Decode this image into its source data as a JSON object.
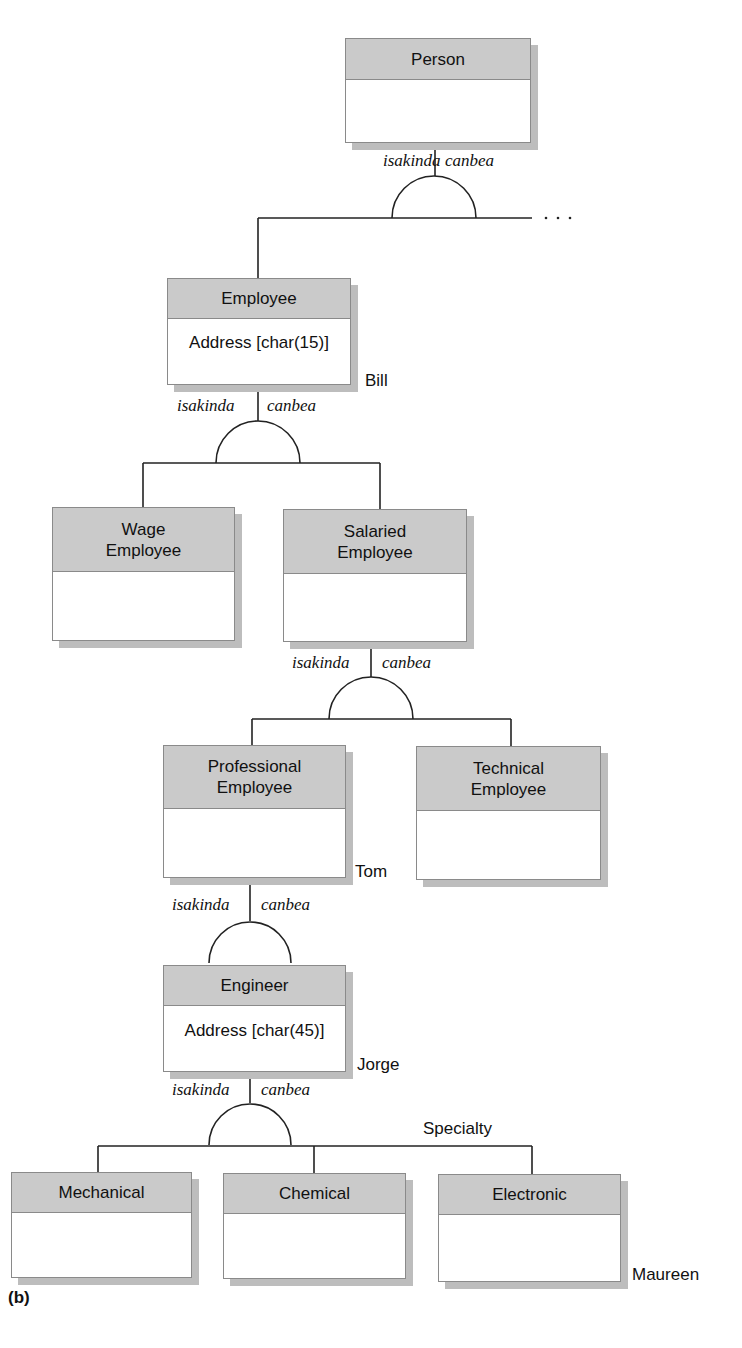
{
  "entities": {
    "person": {
      "name": "Person"
    },
    "employee": {
      "name": "Employee",
      "attribute": "Address [char(15)]"
    },
    "wage_employee": {
      "name_line1": "Wage",
      "name_line2": "Employee"
    },
    "salaried_employee": {
      "name_line1": "Salaried",
      "name_line2": "Employee"
    },
    "professional_employee": {
      "name_line1": "Professional",
      "name_line2": "Employee"
    },
    "technical_employee": {
      "name_line1": "Technical",
      "name_line2": "Employee"
    },
    "engineer": {
      "name": "Engineer",
      "attribute": "Address [char(45)]"
    },
    "mechanical": {
      "name": "Mechanical"
    },
    "chemical": {
      "name": "Chemical"
    },
    "electronic": {
      "name": "Electronic"
    }
  },
  "relationship_labels": {
    "left": "isakinda",
    "right": "canbea"
  },
  "instances": {
    "bill": "Bill",
    "tom": "Tom",
    "jorge": "Jorge",
    "maureen": "Maureen"
  },
  "discriminator": "Specialty",
  "continuation": "· · ·",
  "figure_label": "(b)"
}
